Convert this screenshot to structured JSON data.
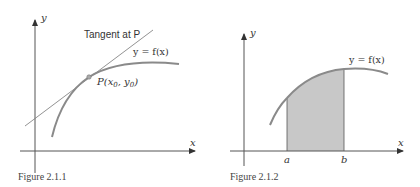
{
  "figures": [
    {
      "caption": "Figure 2.1.1",
      "axes": {
        "x_label": "x",
        "y_label": "y"
      },
      "labels": {
        "tangent": "Tangent at P",
        "curve": "y = f(x)",
        "point_prefix": "P(x",
        "point_sub0": "0",
        "point_mid": ", y",
        "point_sub1": "0",
        "point_suffix": ")"
      },
      "colors": {
        "axis": "#555555",
        "curve": "#8a8a8a",
        "tangent": "#777777",
        "point": "#999999"
      }
    },
    {
      "caption": "Figure 2.1.2",
      "axes": {
        "x_label": "x",
        "y_label": "y"
      },
      "labels": {
        "curve": "y = f(x)",
        "a": "a",
        "b": "b"
      },
      "colors": {
        "axis": "#555555",
        "curve": "#8a8a8a",
        "shaded_region": "#c8c8c8",
        "bounds": "#555555"
      }
    }
  ]
}
